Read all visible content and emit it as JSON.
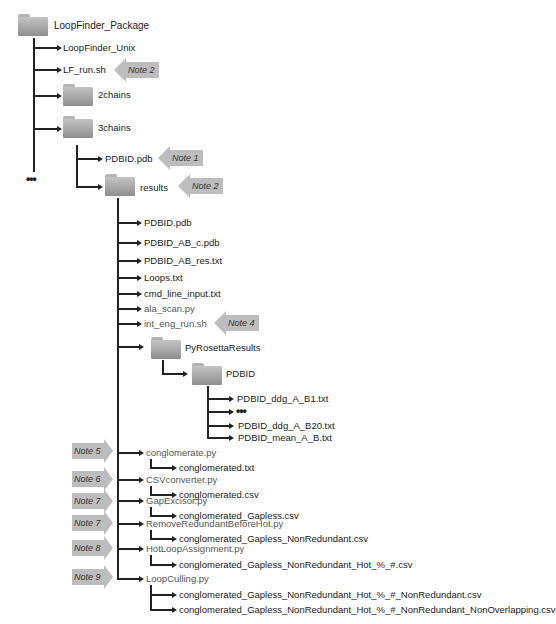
{
  "root": {
    "label": "LoopFinder_Package"
  },
  "level1": {
    "unix": "LoopFinder_Unix",
    "lf_run": "LF_run.sh",
    "chains2": "2chains",
    "chains3": "3chains",
    "more": "•••"
  },
  "chains3": {
    "pdb": "PDBID.pdb",
    "results": "results"
  },
  "results": {
    "items": [
      "PDBID.pdb",
      "PDBID_AB_c.pdb",
      "PDBID_AB_res.txt",
      "Loops.txt",
      "cmd_line_input.txt",
      "ala_scan.py",
      "int_eng_run.sh"
    ],
    "pyrosetta": "PyRosettaResults",
    "pdbid_folder": "PDBID",
    "pdbid_files": [
      "PDBID_ddg_A_B1.txt",
      "•••",
      "PDBID_ddg_A_B20.txt",
      "PDBID_mean_A_B.txt"
    ],
    "scripts": [
      {
        "script": "conglomerate.py",
        "outputs": [
          "conglomerated.txt"
        ]
      },
      {
        "script": "CSVconverter.py",
        "outputs": [
          "conglomerated.csv"
        ]
      },
      {
        "script": "GapExcisor.py",
        "outputs": [
          "conglomerated_Gapless.csv"
        ]
      },
      {
        "script": "RemoveRedundantBeforeHot.py",
        "outputs": [
          "conglomerated_Gapless_NonRedundant.csv"
        ]
      },
      {
        "script": "HotLoopAssignment.py",
        "outputs": [
          "conglomerated_Gapless_NonRedundant_Hot_%_#.csv"
        ]
      },
      {
        "script": "LoopCulling.py",
        "outputs": [
          "conglomerated_Gapless_NonRedundant_Hot_%_#_NonRedundant.csv",
          "conglomerated_Gapless_NonRedundant_Hot_%_#_NonRedundant_NonOverlapping.csv"
        ]
      }
    ]
  },
  "notes": {
    "lf_run": "Note 2",
    "pdb": "Note 1",
    "results": "Note 2",
    "int_eng": "Note 4",
    "conglomerate": "Note 5",
    "csv": "Note 6",
    "gap": "Note 7",
    "remove": "Note 7",
    "hot": "Note 8",
    "culling": "Note 9"
  },
  "colors": {
    "line": "#222222",
    "note": "#bdbdbd",
    "folder_top": "#c4c4c4",
    "folder_bottom": "#8e8e8e"
  }
}
